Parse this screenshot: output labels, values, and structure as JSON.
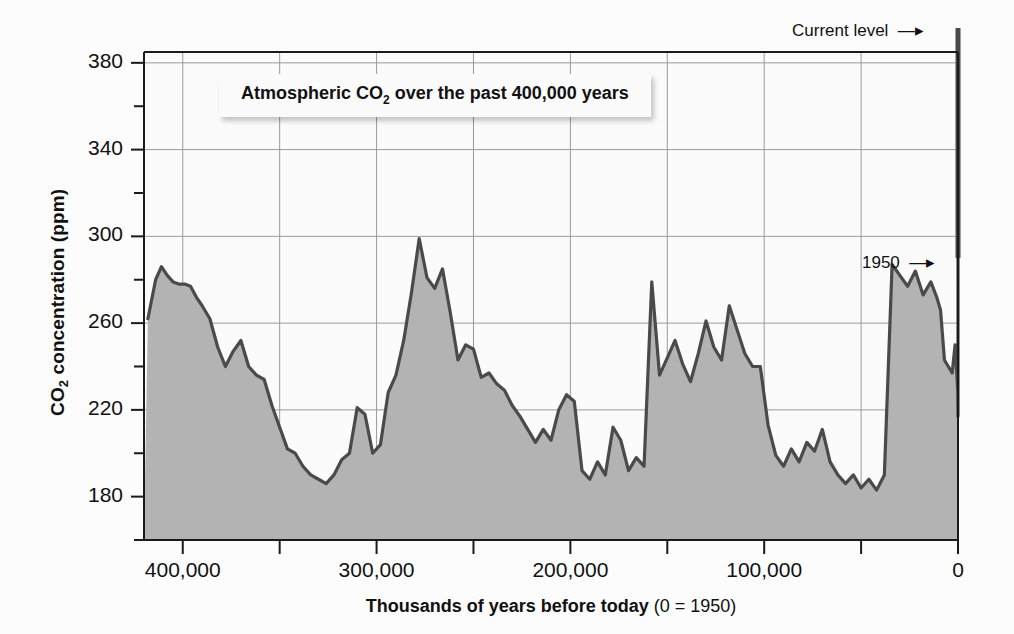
{
  "figure": {
    "background_color": "#fcfcfc",
    "plot_background_color": "#fbfbfb",
    "fill_color": "#b3b3b3",
    "line_color": "#4a4a4a",
    "axis_color": "#1a1a1a",
    "gridline_color": "#9a9a9a"
  },
  "title": {
    "text_before": "Atmospheric CO",
    "subscript": "2",
    "text_after": " over the past 400,000 years",
    "full": "Atmospheric CO2 over the past 400,000 years"
  },
  "axes": {
    "y_title_before": "CO",
    "y_title_sub": "2",
    "y_title_after": " concentration (ppm)",
    "y_title_full": "CO2 concentration (ppm)",
    "x_title_bold": "Thousands of years before today ",
    "x_title_light": "(0 = 1950)",
    "x_title_full": "Thousands of years before today (0 = 1950)",
    "y_ticks": [
      "380",
      "340",
      "300",
      "260",
      "220",
      "180"
    ],
    "y_tick_values": [
      380,
      340,
      300,
      260,
      220,
      180
    ],
    "y_minor_tick_values": [
      360,
      320,
      280,
      240,
      200,
      160
    ],
    "x_ticks": [
      "400,000",
      "300,000",
      "200,000",
      "100,000",
      "0"
    ],
    "x_tick_values": [
      400000,
      300000,
      200000,
      100000,
      0
    ],
    "x_minor_tick_values": [
      350000,
      250000,
      150000,
      50000
    ],
    "ylim": [
      160,
      385
    ],
    "xlim": [
      420000,
      0
    ],
    "grid": "both"
  },
  "annotations": [
    {
      "id": "current-level",
      "label": "Current level",
      "arrow": "→",
      "points_to_x": 0,
      "points_to_y": 385
    },
    {
      "id": "year-1950",
      "label": "1950",
      "arrow": "→",
      "points_to_x": 0,
      "points_to_y": 290
    }
  ],
  "chart_data": {
    "type": "area",
    "title": "Atmospheric CO2 over the past 400,000 years",
    "xlabel": "Thousands of years before today (0 = 1950)",
    "ylabel": "CO2 concentration (ppm)",
    "xlim": [
      420000,
      0
    ],
    "ylim": [
      160,
      385
    ],
    "x_unit": "years before 1950",
    "y_unit": "ppm",
    "grid": true,
    "legend": null,
    "series_name": "Atmospheric CO2 (Vostok ice core + modern record)",
    "x": [
      418000,
      414000,
      411000,
      408000,
      405000,
      402000,
      399000,
      396000,
      393000,
      390000,
      386000,
      382000,
      378000,
      374000,
      370000,
      366000,
      362000,
      358000,
      354000,
      350000,
      346000,
      342000,
      338000,
      334000,
      330000,
      326000,
      322000,
      318000,
      314000,
      310000,
      306000,
      302000,
      298000,
      294000,
      290000,
      286000,
      282000,
      278000,
      274000,
      270000,
      266000,
      262000,
      258000,
      254000,
      250000,
      246000,
      242000,
      238000,
      234000,
      230000,
      226000,
      222000,
      218000,
      214000,
      210000,
      206000,
      202000,
      198000,
      194000,
      190000,
      186000,
      182000,
      178000,
      174000,
      170000,
      166000,
      162000,
      158000,
      154000,
      150000,
      146000,
      142000,
      138000,
      134000,
      130000,
      126000,
      122000,
      118000,
      114000,
      110000,
      106000,
      102000,
      98000,
      94000,
      90000,
      86000,
      82000,
      78000,
      74000,
      70000,
      66000,
      62000,
      58000,
      54000,
      50000,
      46000,
      42000,
      38000,
      34000,
      30000,
      26000,
      22000,
      18000,
      14000,
      11000,
      9000,
      7000,
      5000,
      3000,
      1500,
      500,
      100,
      0
    ],
    "y": [
      262,
      280,
      286,
      282,
      279,
      278,
      278,
      277,
      272,
      268,
      262,
      249,
      240,
      247,
      252,
      240,
      236,
      234,
      222,
      212,
      202,
      200,
      194,
      190,
      188,
      186,
      190,
      197,
      200,
      221,
      218,
      200,
      204,
      228,
      236,
      252,
      274,
      299,
      281,
      276,
      285,
      265,
      243,
      250,
      248,
      235,
      237,
      232,
      229,
      222,
      217,
      211,
      205,
      211,
      206,
      220,
      227,
      224,
      192,
      188,
      196,
      190,
      212,
      206,
      192,
      198,
      194,
      279,
      236,
      244,
      252,
      241,
      233,
      246,
      261,
      249,
      243,
      268,
      257,
      246,
      240,
      240,
      213,
      199,
      194,
      202,
      196,
      205,
      201,
      211,
      196,
      190,
      186,
      190,
      184,
      188,
      183,
      190,
      287,
      282,
      277,
      284,
      273,
      279,
      272,
      266,
      243,
      240,
      237,
      250,
      235,
      228,
      217,
      225,
      231,
      221,
      202,
      210,
      212
    ],
    "annotations": [
      {
        "label": "1950",
        "x": 0,
        "y": 290
      },
      {
        "label": "Current level",
        "x": 0,
        "y": 385
      }
    ]
  }
}
